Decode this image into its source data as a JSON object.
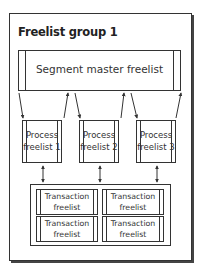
{
  "diagram": {
    "title": "Freelist group 1",
    "segment_master": {
      "label": "Segment master freelist"
    },
    "process_freelists": [
      {
        "line1": "Process",
        "line2": "freelist 1"
      },
      {
        "line1": "Process",
        "line2": "freelist 2"
      },
      {
        "line1": "Process",
        "line2": "freelist 3"
      }
    ],
    "transaction_freelists": [
      {
        "line1": "Transaction",
        "line2": "freelist"
      },
      {
        "line1": "Transaction",
        "line2": "freelist"
      },
      {
        "line1": "Transaction",
        "line2": "freelist"
      },
      {
        "line1": "Transaction",
        "line2": "freelist"
      }
    ],
    "colors": {
      "stroke": "#333333",
      "background": "#ffffff"
    }
  }
}
